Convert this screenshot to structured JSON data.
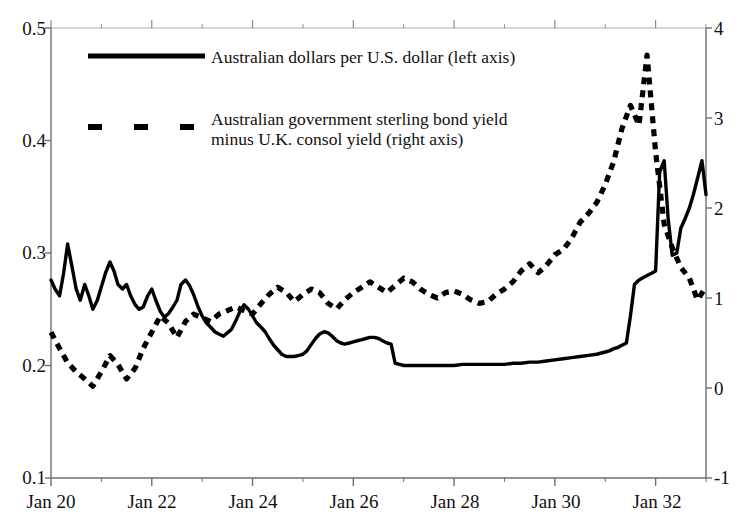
{
  "chart_data": {
    "type": "line",
    "title": "",
    "subtitle": "",
    "xlabel": "",
    "ylabel": "",
    "grid": false,
    "legend_position": "inside-top-left",
    "x_axis": {
      "tick_labels": [
        "Jan 20",
        "Jan 22",
        "Jan 24",
        "Jan 26",
        "Jan 28",
        "Jan 30",
        "Jan 32"
      ],
      "tick_values": [
        1920.0,
        1922.0,
        1924.0,
        1926.0,
        1928.0,
        1930.0,
        1932.0
      ],
      "minor_ticks_per_major": 2,
      "xlim": [
        1920.0,
        1933.0
      ]
    },
    "y_axis_left": {
      "tick_labels": [
        "0.1",
        "0.2",
        "0.3",
        "0.4",
        "0.5"
      ],
      "tick_values": [
        0.1,
        0.2,
        0.3,
        0.4,
        0.5
      ],
      "ylim": [
        0.1,
        0.5
      ]
    },
    "y_axis_right": {
      "tick_labels": [
        "-1",
        "0",
        "1",
        "2",
        "3",
        "4"
      ],
      "tick_values": [
        -1,
        0,
        1,
        2,
        3,
        4
      ],
      "ylim": [
        -1,
        4
      ]
    },
    "series": [
      {
        "name": "Australian dollars per U.S. dollar (left axis)",
        "style": "solid",
        "axis": "left",
        "color": "#000000",
        "x": [
          1920.0,
          1920.08,
          1920.17,
          1920.25,
          1920.33,
          1920.42,
          1920.5,
          1920.58,
          1920.67,
          1920.75,
          1920.83,
          1920.92,
          1921.0,
          1921.08,
          1921.17,
          1921.25,
          1921.33,
          1921.42,
          1921.5,
          1921.58,
          1921.67,
          1921.75,
          1921.83,
          1921.92,
          1922.0,
          1922.08,
          1922.17,
          1922.25,
          1922.33,
          1922.42,
          1922.5,
          1922.58,
          1922.67,
          1922.75,
          1922.83,
          1922.92,
          1923.0,
          1923.08,
          1923.17,
          1923.25,
          1923.33,
          1923.42,
          1923.5,
          1923.58,
          1923.67,
          1923.75,
          1923.83,
          1923.92,
          1924.0,
          1924.08,
          1924.17,
          1924.25,
          1924.33,
          1924.42,
          1924.5,
          1924.58,
          1924.67,
          1924.75,
          1924.83,
          1924.92,
          1925.0,
          1925.08,
          1925.17,
          1925.25,
          1925.33,
          1925.42,
          1925.5,
          1925.58,
          1925.67,
          1925.75,
          1925.83,
          1925.92,
          1926.0,
          1926.08,
          1926.17,
          1926.25,
          1926.33,
          1926.42,
          1926.5,
          1926.58,
          1926.67,
          1926.75,
          1926.83,
          1926.92,
          1927.0,
          1927.17,
          1927.33,
          1927.5,
          1927.67,
          1927.83,
          1928.0,
          1928.17,
          1928.33,
          1928.5,
          1928.67,
          1928.83,
          1929.0,
          1929.17,
          1929.33,
          1929.5,
          1929.67,
          1929.83,
          1930.0,
          1930.17,
          1930.33,
          1930.5,
          1930.67,
          1930.83,
          1931.0,
          1931.08,
          1931.17,
          1931.25,
          1931.33,
          1931.42,
          1931.5,
          1931.58,
          1931.67,
          1931.75,
          1931.83,
          1931.92,
          1932.0,
          1932.08,
          1932.17,
          1932.25,
          1932.33,
          1932.42,
          1932.5,
          1932.58,
          1932.67,
          1932.75,
          1932.83,
          1932.92,
          1933.0
        ],
        "y": [
          0.276,
          0.268,
          0.262,
          0.282,
          0.308,
          0.287,
          0.268,
          0.258,
          0.272,
          0.262,
          0.25,
          0.258,
          0.27,
          0.282,
          0.292,
          0.284,
          0.272,
          0.268,
          0.272,
          0.262,
          0.254,
          0.25,
          0.252,
          0.262,
          0.268,
          0.258,
          0.248,
          0.243,
          0.246,
          0.252,
          0.258,
          0.272,
          0.276,
          0.271,
          0.263,
          0.252,
          0.244,
          0.238,
          0.234,
          0.23,
          0.228,
          0.226,
          0.229,
          0.232,
          0.24,
          0.248,
          0.254,
          0.25,
          0.244,
          0.238,
          0.234,
          0.23,
          0.224,
          0.218,
          0.214,
          0.21,
          0.208,
          0.208,
          0.208,
          0.209,
          0.21,
          0.213,
          0.219,
          0.224,
          0.228,
          0.23,
          0.229,
          0.226,
          0.222,
          0.22,
          0.219,
          0.22,
          0.221,
          0.222,
          0.223,
          0.224,
          0.225,
          0.225,
          0.224,
          0.222,
          0.22,
          0.219,
          0.202,
          0.201,
          0.2,
          0.2,
          0.2,
          0.2,
          0.2,
          0.2,
          0.2,
          0.201,
          0.201,
          0.201,
          0.201,
          0.201,
          0.201,
          0.202,
          0.202,
          0.203,
          0.203,
          0.204,
          0.205,
          0.206,
          0.207,
          0.208,
          0.209,
          0.21,
          0.212,
          0.213,
          0.215,
          0.216,
          0.218,
          0.22,
          0.244,
          0.272,
          0.276,
          0.278,
          0.28,
          0.282,
          0.284,
          0.372,
          0.382,
          0.33,
          0.298,
          0.3,
          0.322,
          0.33,
          0.34,
          0.352,
          0.366,
          0.382,
          0.352
        ],
        "notes": "Declines from ~0.28 in 1920 with early volatility, long flat plateau near 0.20 through late 1920s, then rises sharply after 1931 devaluation peaking near 0.38"
      },
      {
        "name": "Australian government sterling bond yield minus U.K. consol yield (right axis)",
        "style": "dashed",
        "axis": "right",
        "color": "#000000",
        "x": [
          1920.0,
          1920.17,
          1920.33,
          1920.5,
          1920.67,
          1920.83,
          1921.0,
          1921.17,
          1921.33,
          1921.5,
          1921.67,
          1921.83,
          1922.0,
          1922.17,
          1922.33,
          1922.5,
          1922.67,
          1922.83,
          1923.0,
          1923.17,
          1923.33,
          1923.5,
          1923.67,
          1923.83,
          1924.0,
          1924.17,
          1924.33,
          1924.5,
          1924.67,
          1924.83,
          1925.0,
          1925.17,
          1925.33,
          1925.5,
          1925.67,
          1925.83,
          1926.0,
          1926.17,
          1926.33,
          1926.5,
          1926.67,
          1926.83,
          1927.0,
          1927.17,
          1927.33,
          1927.5,
          1927.67,
          1927.83,
          1928.0,
          1928.17,
          1928.33,
          1928.5,
          1928.67,
          1928.83,
          1929.0,
          1929.17,
          1929.33,
          1929.5,
          1929.67,
          1929.83,
          1930.0,
          1930.17,
          1930.33,
          1930.5,
          1930.67,
          1930.83,
          1931.0,
          1931.17,
          1931.33,
          1931.5,
          1931.67,
          1931.83,
          1932.0,
          1932.17,
          1932.33,
          1932.5,
          1932.67,
          1932.83,
          1933.0
        ],
        "y": [
          0.62,
          0.44,
          0.28,
          0.18,
          0.1,
          0.02,
          0.18,
          0.36,
          0.26,
          0.1,
          0.22,
          0.44,
          0.62,
          0.8,
          0.72,
          0.56,
          0.74,
          0.82,
          0.78,
          0.74,
          0.82,
          0.86,
          0.9,
          0.86,
          0.82,
          0.94,
          1.04,
          1.12,
          1.06,
          0.96,
          1.04,
          1.1,
          1.06,
          0.94,
          0.88,
          0.98,
          1.06,
          1.12,
          1.18,
          1.12,
          1.06,
          1.14,
          1.22,
          1.18,
          1.1,
          1.04,
          1.0,
          1.06,
          1.08,
          1.04,
          0.98,
          0.94,
          0.96,
          1.04,
          1.1,
          1.18,
          1.3,
          1.38,
          1.28,
          1.36,
          1.48,
          1.54,
          1.66,
          1.84,
          1.94,
          2.06,
          2.26,
          2.52,
          2.88,
          3.14,
          2.92,
          3.7,
          2.62,
          1.82,
          1.56,
          1.34,
          1.22,
          0.98,
          1.12
        ],
        "notes": "Low near 0 in 1920, rises to ~1 through mid 1920s, then surges sharply after 1930 peaking at ~3.7 in 1931-32 before falling back near 1"
      }
    ],
    "annotations": []
  },
  "legend": {
    "entries": [
      {
        "marker": "solid-line-swatch",
        "lines": [
          "Australian dollars per U.S. dollar (left axis)"
        ]
      },
      {
        "marker": "dashed-line-swatch",
        "lines": [
          "Australian government sterling bond yield",
          "minus U.K. consol yield (right axis)"
        ]
      }
    ]
  },
  "colors": {
    "series": "#000000",
    "axis": "#6f6f6f",
    "text": "#111111",
    "background": "#ffffff"
  }
}
